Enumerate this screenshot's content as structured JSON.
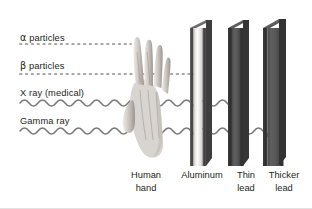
{
  "figure": {
    "background_color": "#ffffff"
  },
  "rays": [
    {
      "id": "alpha",
      "label": "α particles",
      "symbol": "α",
      "name": "particles",
      "line_style": "dotted",
      "color": "#8a8a8a",
      "y": 44,
      "start_x": 20,
      "stop_x": 131,
      "stopped_by": "Human hand"
    },
    {
      "id": "beta",
      "label": "β particles",
      "symbol": "β",
      "name": "particles",
      "line_style": "dotted",
      "color": "#8a8a8a",
      "y": 74,
      "start_x": 20,
      "stop_x": 201,
      "stopped_by": "Aluminum"
    },
    {
      "id": "xray",
      "label": "X ray (medical)",
      "line_style": "wave",
      "color": "#7a7a7a",
      "y": 103,
      "start_x": 20,
      "stop_x": 240,
      "stopped_by": "Thin lead"
    },
    {
      "id": "gamma",
      "label": "Gamma ray",
      "line_style": "wave",
      "color": "#7a7a7a",
      "y": 131,
      "start_x": 20,
      "stop_x": 276,
      "stopped_by": "Thicker lead"
    }
  ],
  "barriers": [
    {
      "id": "hand",
      "caption": "Human\nhand",
      "caption_line1": "Human",
      "caption_line2": "hand",
      "x": 128,
      "material": "skin"
    },
    {
      "id": "aluminum",
      "caption": "Aluminum",
      "caption_line1": "Aluminum",
      "caption_line2": "",
      "x": 190,
      "width": 16,
      "face_color": "#e6e4e1",
      "edge_color": "#4e4e4e"
    },
    {
      "id": "thin-lead",
      "caption": "Thin\nlead",
      "caption_line1": "Thin",
      "caption_line2": "lead",
      "x": 228,
      "width": 16,
      "face_color": "#555555",
      "edge_color": "#3a3a3a"
    },
    {
      "id": "thicker-lead",
      "caption": "Thicker\nlead",
      "caption_line1": "Thicker",
      "caption_line2": "lead",
      "x": 263,
      "width": 22,
      "face_color": "#4f4f4f",
      "edge_color": "#363636"
    }
  ],
  "colors": {
    "text": "#231f20",
    "dotted_line": "#8a8a8a",
    "wave_line": "#7a7a7a",
    "border": "#e2e2e2"
  }
}
